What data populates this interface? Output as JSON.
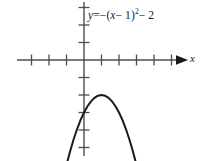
{
  "figure": {
    "name": "parabola-graph",
    "background_color": "#ffffff",
    "stroke_color": "#1a1a1a",
    "axis_color": "#4d4d4d"
  },
  "equation": {
    "lhs": "y",
    "equals": "=",
    "rhs_prefix": "−(",
    "rhs_var": "x",
    "rhs_minus": "− 1)",
    "rhs_exponent": "2",
    "rhs_suffix": "− 2",
    "full_text": "y = −(x − 1)² − 2"
  },
  "axes": {
    "x_label": "x",
    "y_label": "",
    "x_arrow": "right-arrow",
    "origin_px": [
      84,
      60
    ],
    "unit_px": 17.5,
    "x_ticks_left": 4,
    "x_ticks_right": 5,
    "y_ticks_up": 3,
    "y_ticks_down": 5
  },
  "chart_data": {
    "type": "line",
    "title": "",
    "xlabel": "x",
    "ylabel": "",
    "grid": false,
    "legend": null,
    "annotations": [
      {
        "text": "y = −(x − 1)² − 2",
        "x": 1.9,
        "y": 3.4
      }
    ],
    "xlim": [
      -4.8,
      6.9
    ],
    "ylim": [
      -5.7,
      3.4
    ],
    "series": [
      {
        "name": "y = -(x - 1)^2 - 2",
        "equation": "y = -(x - 1)^2 - 2",
        "vertex": [
          1,
          -2
        ],
        "opens": "down",
        "leading_coefficient": -1,
        "arrow_ends": [
          "down-left",
          "down-right"
        ],
        "x": [
          -1.2,
          -1.0,
          -0.8,
          -0.6,
          -0.4,
          -0.2,
          0.0,
          0.2,
          0.4,
          0.6,
          0.8,
          1.0,
          1.2,
          1.4,
          1.6,
          1.8,
          2.0,
          2.2,
          2.4,
          2.6,
          2.8,
          3.0,
          3.2
        ],
        "y": [
          -6.84,
          -6.0,
          -5.24,
          -4.56,
          -3.96,
          -3.44,
          -3.0,
          -2.64,
          -2.36,
          -2.16,
          -2.04,
          -2.0,
          -2.04,
          -2.16,
          -2.36,
          -2.64,
          -3.0,
          -3.44,
          -3.96,
          -4.56,
          -5.24,
          -6.0,
          -6.84
        ]
      }
    ]
  }
}
